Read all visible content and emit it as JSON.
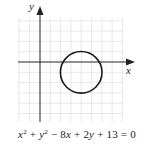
{
  "diagram": {
    "type": "coordinate-plane-graph",
    "axes": {
      "x_label": "x",
      "y_label": "y",
      "x_range_units": [
        -2,
        8
      ],
      "y_range_units": [
        -6,
        4
      ]
    },
    "grid": {
      "visible": true,
      "unit_px": 10.3,
      "color": "#d9d9d9"
    },
    "curve": {
      "shape": "circle",
      "center": [
        4,
        -1
      ],
      "radius": 2,
      "stroke_color": "#1a1a1a"
    },
    "equation": {
      "text": "x² + y² − 8x + 2y + 13 = 0",
      "parts": {
        "t1": "x",
        "t1_exp": "2",
        "op1": " + ",
        "t2": "y",
        "t2_exp": "2",
        "op2": " − 8",
        "t3": "x",
        "op3": " + 2",
        "t4": "y",
        "op4": " + 13 = 0"
      }
    }
  }
}
